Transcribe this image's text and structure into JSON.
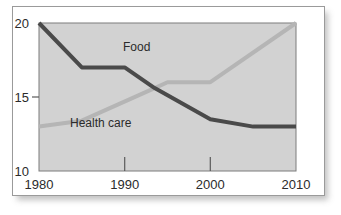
{
  "chart_data": {
    "type": "line",
    "title": "",
    "xlabel": "",
    "ylabel": "",
    "xlim": [
      1980,
      2010
    ],
    "ylim": [
      10,
      20
    ],
    "grid": false,
    "legend": "inline-labels",
    "x_tick_labels": [
      "1980",
      "1990",
      "2000",
      "2010"
    ],
    "x_ticks": [
      1980,
      1990,
      2000,
      2010
    ],
    "y_tick_labels": [
      "20",
      "15",
      "10"
    ],
    "y_ticks": [
      20,
      15,
      10
    ],
    "series": [
      {
        "name": "Food",
        "color": "#4a4a4a",
        "x": [
          1980,
          1985,
          1990,
          1993.5,
          2000,
          2005,
          2010
        ],
        "values": [
          20,
          17,
          17,
          15.6,
          13.5,
          13,
          13
        ]
      },
      {
        "name": "Health care",
        "color": "#b5b5b5",
        "x": [
          1980,
          1985,
          1993.5,
          1995,
          2000,
          2010
        ],
        "values": [
          13,
          13.4,
          15.6,
          16,
          16,
          20
        ]
      }
    ],
    "annotations": [
      {
        "text": "Food",
        "x": 1991.4,
        "y": 18.1
      },
      {
        "text": "Health care",
        "x": 1987.2,
        "y": 13.0
      }
    ]
  },
  "style": {
    "plot_background": "#d2d2d2",
    "plot_border": "#7d7d7d",
    "card_background": "#ffffff",
    "card_border": "#9a9a9a",
    "text_color": "#2b2b2b"
  }
}
